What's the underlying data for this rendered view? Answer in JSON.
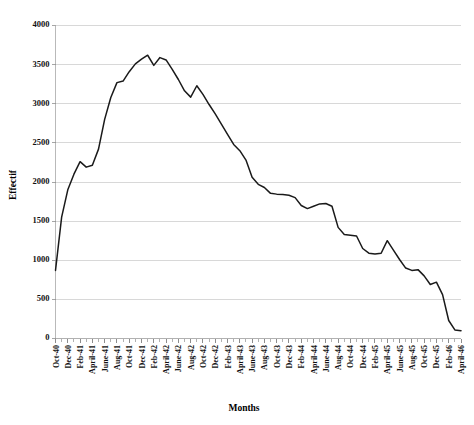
{
  "chart_data": {
    "type": "line",
    "title": "",
    "xlabel": "Months",
    "ylabel": "Effectif",
    "ylim": [
      0,
      4000
    ],
    "ytick_step": 500,
    "yticks": [
      0,
      500,
      1000,
      1500,
      2000,
      2500,
      3000,
      3500,
      4000
    ],
    "ytick_labels": [
      "0",
      "500",
      "1000",
      "1500",
      "2000",
      "2500",
      "3000",
      "3500",
      "4000"
    ],
    "grid": true,
    "legend": "none",
    "line_color": "#1a1a1a",
    "grid_color": "#c8c8c8",
    "x_label_interval": 2,
    "x_labels_shown": [
      "Oct-40",
      "Dec-40",
      "Feb-41",
      "April-41",
      "June-41",
      "Aug-41",
      "Oct-41",
      "Dec-41",
      "Feb-42",
      "April-42",
      "June-42",
      "Aug-42",
      "Oct-42",
      "Dec-42",
      "Feb-43",
      "April-43",
      "June-43",
      "Aug-43",
      "Oct-43",
      "Dec-43",
      "Feb-44",
      "April-44",
      "June-44",
      "Aug-44",
      "Oct-44",
      "Dec-44",
      "Feb-45",
      "April-45",
      "June-45",
      "Aug-45",
      "Oct-45",
      "Dec-45",
      "Feb-46",
      "April-46"
    ],
    "categories": [
      "Oct-40",
      "Nov-40",
      "Dec-40",
      "Jan-41",
      "Feb-41",
      "Mar-41",
      "April-41",
      "May-41",
      "June-41",
      "July-41",
      "Aug-41",
      "Sep-41",
      "Oct-41",
      "Nov-41",
      "Dec-41",
      "Jan-42",
      "Feb-42",
      "Mar-42",
      "April-42",
      "May-42",
      "June-42",
      "July-42",
      "Aug-42",
      "Sep-42",
      "Oct-42",
      "Nov-42",
      "Dec-42",
      "Jan-43",
      "Feb-43",
      "Mar-43",
      "April-43",
      "May-43",
      "June-43",
      "July-43",
      "Aug-43",
      "Sep-43",
      "Oct-43",
      "Nov-43",
      "Dec-43",
      "Jan-44",
      "Feb-44",
      "Mar-44",
      "April-44",
      "May-44",
      "June-44",
      "July-44",
      "Aug-44",
      "Sep-44",
      "Oct-44",
      "Nov-44",
      "Dec-44",
      "Jan-45",
      "Feb-45",
      "Mar-45",
      "April-45",
      "May-45",
      "June-45",
      "July-45",
      "Aug-45",
      "Sep-45",
      "Oct-45",
      "Nov-45",
      "Dec-45",
      "Jan-46",
      "Feb-46",
      "Mar-46",
      "April-46"
    ],
    "values": [
      870,
      1550,
      1900,
      2100,
      2260,
      2190,
      2215,
      2420,
      2800,
      3080,
      3270,
      3290,
      3410,
      3510,
      3570,
      3620,
      3490,
      3590,
      3560,
      3440,
      3310,
      3165,
      3085,
      3230,
      3120,
      2990,
      2870,
      2740,
      2610,
      2480,
      2400,
      2280,
      2060,
      1970,
      1930,
      1855,
      1845,
      1840,
      1830,
      1800,
      1700,
      1660,
      1690,
      1720,
      1725,
      1690,
      1420,
      1330,
      1320,
      1310,
      1150,
      1090,
      1080,
      1090,
      1250,
      1130,
      1010,
      900,
      870,
      880,
      800,
      690,
      720,
      560,
      230,
      110,
      100
    ]
  },
  "axis": {
    "ylabel": "Effectif",
    "xlabel": "Months"
  }
}
